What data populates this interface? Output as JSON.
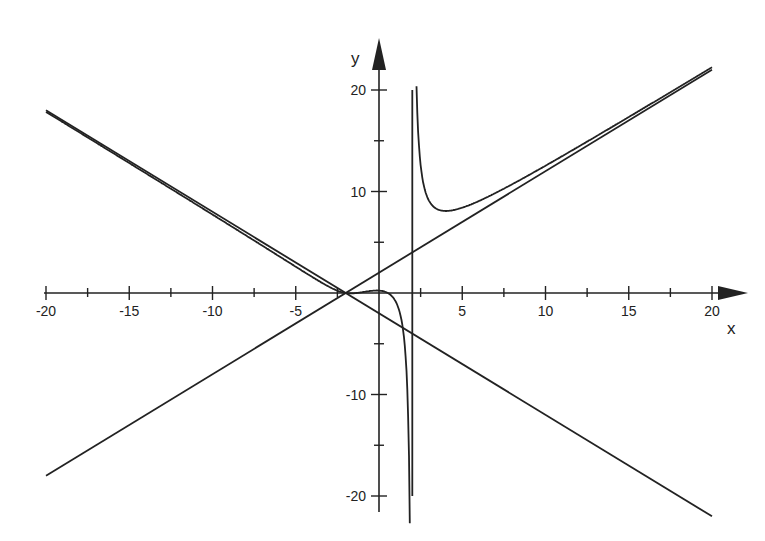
{
  "chart_data": {
    "type": "line",
    "title": "",
    "xlabel": "x",
    "ylabel": "y",
    "xlim": [
      -20,
      20
    ],
    "ylim": [
      -22,
      22
    ],
    "grid": false,
    "legend": null,
    "x_ticks": [
      -20,
      -15,
      -10,
      -5,
      5,
      10,
      15,
      20
    ],
    "x_tick_labels": [
      "-20",
      "-15",
      "-10",
      "-5",
      "5",
      "10",
      "15",
      "20"
    ],
    "y_ticks": [
      20,
      10,
      -10,
      -20
    ],
    "y_tick_labels": [
      "20",
      "10",
      "-10",
      "-20"
    ],
    "series": [
      {
        "name": "asymptote y = x + 2",
        "points": [
          [
            -20,
            -18
          ],
          [
            20,
            22
          ]
        ]
      },
      {
        "name": "asymptote y = -x - 2",
        "points": [
          [
            -20,
            18
          ],
          [
            20,
            -22
          ]
        ]
      },
      {
        "name": "vertical asymptote x = 2",
        "points": [
          [
            2,
            -20
          ],
          [
            2,
            20
          ]
        ]
      },
      {
        "name": "curve",
        "key_points": [
          [
            -20,
            18
          ],
          [
            -2,
            0.5
          ],
          [
            0,
            -0.3
          ],
          [
            1,
            0
          ],
          [
            1.8,
            22
          ],
          [
            2.3,
            22
          ],
          [
            4,
            7.5
          ],
          [
            20,
            22.2
          ]
        ]
      }
    ],
    "colors": {
      "line": "#222222",
      "background": "#ffffff"
    }
  }
}
